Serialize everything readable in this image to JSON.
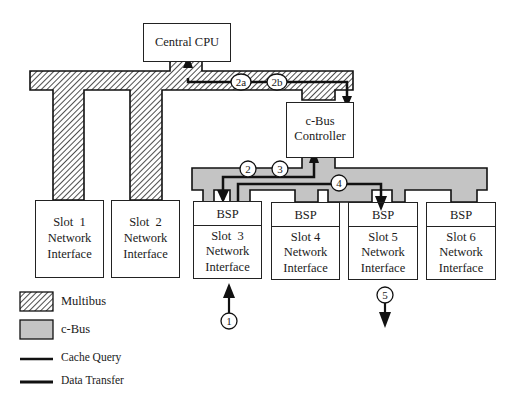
{
  "diagram": {
    "central_cpu": "Central CPU",
    "cbus_controller": [
      "c-Bus",
      "Controller"
    ],
    "slots": [
      {
        "id": "slot1",
        "lines": [
          "Slot  1",
          "Network",
          "Interface"
        ],
        "bsp": null,
        "bus": "Multibus"
      },
      {
        "id": "slot2",
        "lines": [
          "Slot  2",
          "Network",
          "Interface"
        ],
        "bsp": null,
        "bus": "Multibus"
      },
      {
        "id": "slot3",
        "lines": [
          "Slot  3",
          "Network",
          "Interface"
        ],
        "bsp": "BSP",
        "bus": "c-Bus"
      },
      {
        "id": "slot4",
        "lines": [
          "Slot 4",
          "Network",
          "Interface"
        ],
        "bsp": "BSP",
        "bus": "c-Bus"
      },
      {
        "id": "slot5",
        "lines": [
          "Slot 5",
          "Network",
          "Interface"
        ],
        "bsp": "BSP",
        "bus": "c-Bus"
      },
      {
        "id": "slot6",
        "lines": [
          "Slot 6",
          "Network",
          "Interface"
        ],
        "bsp": "BSP",
        "bus": "c-Bus"
      }
    ],
    "step_markers": [
      "1",
      "2",
      "2a",
      "2b",
      "3",
      "4",
      "5"
    ],
    "legend": {
      "multibus": "Multibus",
      "cbus": "c-Bus",
      "cache_query": "Cache Query",
      "data_transfer": "Data Transfer"
    },
    "colors": {
      "line": "#111111",
      "cbus_fill": "#c4c4c4",
      "hatch": "#222222",
      "background": "#ffffff"
    }
  }
}
